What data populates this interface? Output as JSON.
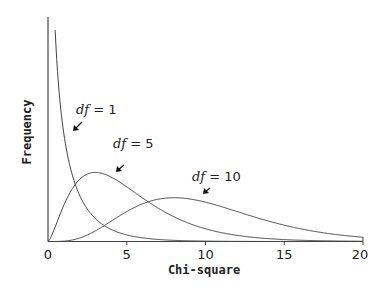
{
  "chart_data": {
    "type": "line",
    "title": "",
    "xlabel": "Chi-square",
    "ylabel": "Frequency",
    "xlim": [
      0,
      20
    ],
    "xticks": [
      0,
      5,
      10,
      15,
      20
    ],
    "yticks": [],
    "grid": false,
    "legend": "none (inline annotations with arrows)",
    "series": [
      {
        "name": "df = 1",
        "df": 1,
        "description": "chi-square density with 1 degree of freedom; asymptotic at 0, decaying rapidly"
      },
      {
        "name": "df = 5",
        "df": 5,
        "peak_x": 3,
        "peak_density": 0.154
      },
      {
        "name": "df = 10",
        "df": 10,
        "peak_x": 8,
        "peak_density": 0.098
      }
    ],
    "annotations": [
      {
        "text": "df = 1",
        "points_to_series": "df = 1"
      },
      {
        "text": "df = 5",
        "points_to_series": "df = 5"
      },
      {
        "text": "df = 10",
        "points_to_series": "df = 10"
      }
    ]
  },
  "labels": {
    "xlabel": "Chi-square",
    "ylabel": "Frequency",
    "ticks": [
      "0",
      "5",
      "10",
      "15",
      "20"
    ],
    "ann_df": "df",
    "ann1": " = 1",
    "ann5": " = 5",
    "ann10": " = 10"
  }
}
